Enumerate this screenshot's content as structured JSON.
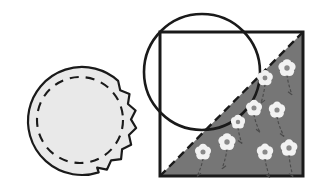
{
  "figure": {
    "background_color": "#ffffff",
    "width": 328,
    "height": 191,
    "outline_color": "#1a1a1a",
    "light_fill": "#e9e9e9",
    "shaded_fill": "#767676",
    "flower_fill": "#f2f2f2",
    "flower_center": "#8a8a8a",
    "stem_color": "#4a4a4a"
  },
  "shapes": {
    "left_figure": {
      "name": "torn-circle",
      "label": "Circle with dashed inner circle and zigzag torn right edge",
      "center_x": 82,
      "center_y": 121,
      "radius": 54,
      "fill": "#e9e9e9",
      "stroke": "#1a1a1a",
      "stroke_width": 2.2,
      "inner_dashed_circle": {
        "name": "inner-dashed-circle",
        "center_x": 80,
        "center_y": 120,
        "radius": 43,
        "dash_pattern": "9 7",
        "stroke": "#1a1a1a",
        "stroke_width": 2.1
      },
      "zigzag_edge": {
        "name": "zigzag-torn-edge",
        "side": "right",
        "teeth": 13,
        "amplitude": 5,
        "start_angle_deg": -48,
        "end_angle_deg": 72
      }
    },
    "right_figure": {
      "name": "square-with-circle-and-shaded-triangle",
      "square": {
        "name": "outer-square",
        "x": 160,
        "y": 32,
        "width": 143,
        "height": 144,
        "stroke": "#1a1a1a",
        "stroke_width": 3.0,
        "fill": "#ffffff"
      },
      "circle": {
        "name": "overlapping-circle",
        "center_x": 202,
        "center_y": 72,
        "radius": 58,
        "stroke": "#1a1a1a",
        "stroke_width": 2.6,
        "fill": "none"
      },
      "diagonal": {
        "name": "dashed-diagonal",
        "x1": 160,
        "y1": 176,
        "x2": 303,
        "y2": 32,
        "dash_pattern": "8 5",
        "stroke": "#1a1a1a",
        "stroke_width": 2.4
      },
      "shaded_triangle": {
        "name": "shaded-triangle-region",
        "points": "160,176 303,32 303,176",
        "fill": "#767676"
      },
      "flowers": [
        {
          "name": "flower",
          "x": 287,
          "y": 68,
          "size": 9.0,
          "stem_length": 20,
          "stem_bend": 5
        },
        {
          "name": "flower",
          "x": 265,
          "y": 78,
          "size": 8.2,
          "stem_length": 19,
          "stem_bend": -4
        },
        {
          "name": "flower",
          "x": 254,
          "y": 108,
          "size": 8.4,
          "stem_length": 18,
          "stem_bend": 6
        },
        {
          "name": "flower",
          "x": 277,
          "y": 110,
          "size": 8.6,
          "stem_length": 20,
          "stem_bend": 7
        },
        {
          "name": "flower",
          "x": 227,
          "y": 142,
          "size": 9.0,
          "stem_length": 20,
          "stem_bend": -5
        },
        {
          "name": "flower",
          "x": 265,
          "y": 152,
          "size": 8.6,
          "stem_length": 19,
          "stem_bend": 5
        },
        {
          "name": "flower",
          "x": 289,
          "y": 148,
          "size": 8.8,
          "stem_length": 22,
          "stem_bend": 4
        },
        {
          "name": "flower",
          "x": 203,
          "y": 152,
          "size": 8.4,
          "stem_length": 18,
          "stem_bend": -6
        },
        {
          "name": "flower",
          "x": 238,
          "y": 122,
          "size": 7.4,
          "stem_length": 16,
          "stem_bend": 4
        }
      ]
    }
  }
}
